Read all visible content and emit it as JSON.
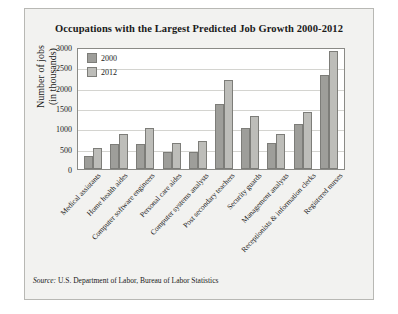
{
  "chart_data": {
    "type": "bar",
    "title": "Occupations with the Largest Predicted Job Growth 2000-2012",
    "xlabel": "",
    "ylabel": "Number of jobs\n(in thousands)",
    "ylabel_line1": "Number of jobs",
    "ylabel_line2": "(in thousands)",
    "ylim": [
      0,
      3000
    ],
    "yticks": [
      0,
      500,
      1000,
      1500,
      2000,
      2500,
      3000
    ],
    "grid": true,
    "legend_position": "top-left-inside",
    "categories": [
      "Medical assistants",
      "Home health aides",
      "Computer software engineers",
      "Personal care aides",
      "Computer systems analysts",
      "Post secondary teachers",
      "Security guards",
      "Management analysts",
      "Receptionists & information clerks",
      "Registered nurses"
    ],
    "series": [
      {
        "name": "2000",
        "color": "#9e9e9a",
        "values": [
          330,
          620,
          620,
          410,
          430,
          1600,
          1000,
          650,
          1100,
          2300
        ]
      },
      {
        "name": "2012",
        "color": "#bdbdb9",
        "values": [
          520,
          860,
          1000,
          640,
          690,
          2200,
          1300,
          850,
          1400,
          2900
        ]
      }
    ]
  },
  "source": {
    "prefix": "Source:",
    "text": "U.S. Department of Labor, Bureau of Labor Statistics"
  }
}
